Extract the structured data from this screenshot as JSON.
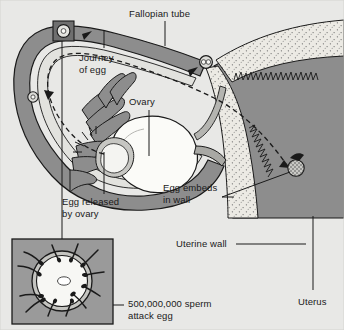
{
  "figure": {
    "background_color": "#e8e8e6",
    "ink_color": "#1a1a1a"
  },
  "palette": {
    "background": "#e8e8e6",
    "tube_wall": "#8d8d8d",
    "tube_lumen": "#e2e2de",
    "uterus_muscle": "#8d8d8d",
    "uterine_wall_stipple": "#eceae4",
    "ovary_fill": "#fbfbf8",
    "inset_background": "#9a9a9a",
    "egg_marker_fill": "#dddddd",
    "outline": "#1a1a1a"
  },
  "labels": [
    {
      "id": "fallopian-tube",
      "text": "Fallopian tube",
      "x": 129,
      "y": 8,
      "lines": [
        "Fallopian tube"
      ]
    },
    {
      "id": "journey-of-egg",
      "text": "Journey of egg",
      "x": 79,
      "y": 52,
      "lines": [
        "Journey",
        "of egg"
      ]
    },
    {
      "id": "ovary",
      "text": "Ovary",
      "x": 129,
      "y": 96,
      "lines": [
        "Ovary"
      ]
    },
    {
      "id": "egg-released",
      "text": "Egg released by ovary",
      "x": 62,
      "y": 198,
      "lines": [
        "Egg released",
        "by ovary"
      ]
    },
    {
      "id": "egg-embeds",
      "text": "Egg embeds in wall",
      "x": 163,
      "y": 183,
      "lines": [
        "Egg embeds",
        "in wall"
      ]
    },
    {
      "id": "uterine-wall",
      "text": "Uterine wall",
      "x": 176,
      "y": 239,
      "lines": [
        "Uterine wall"
      ]
    },
    {
      "id": "uterus",
      "text": "Uterus",
      "x": 298,
      "y": 296,
      "lines": [
        "Uterus"
      ]
    },
    {
      "id": "sperm-attack",
      "text": "500,000,000 sperm attack egg",
      "x": 128,
      "y": 299,
      "lines": [
        "500,000,000 sperm",
        "attack egg"
      ]
    }
  ],
  "structures": [
    {
      "id": "fallopian-tube",
      "name": "Fallopian tube",
      "description": "Long curved muscular tube with an inner lumen running from the fimbriae to the uterus"
    },
    {
      "id": "ovary",
      "name": "Ovary",
      "description": "Pale oval organ below the tube where the egg is released"
    },
    {
      "id": "fimbriae",
      "name": "Fimbriae",
      "description": "Finger-like projections at the open end of the tube that sweep the egg inward"
    },
    {
      "id": "uterus",
      "name": "Uterus",
      "description": "Large dark muscular cavity on the right side of the diagram"
    },
    {
      "id": "uterine-wall",
      "name": "Uterine wall",
      "description": "Stippled lining layer of the uterus"
    },
    {
      "id": "embedded-egg",
      "name": "Embedded egg",
      "description": "Stippled round egg implanted in the uterine wall"
    }
  ],
  "journey_markers": [
    {
      "id": "marker-released",
      "stage": "Egg released by ovary",
      "x": 33,
      "y": 97,
      "r": 5.0,
      "boxed": false
    },
    {
      "id": "marker-boxed",
      "stage": "Sperm attack egg (inset)",
      "x": 64,
      "y": 31,
      "r": 5.4,
      "boxed": true
    },
    {
      "id": "marker-dividing",
      "stage": "Fertilised egg dividing",
      "x": 206,
      "y": 62,
      "r": 5.6,
      "boxed": false
    },
    {
      "id": "marker-embedded",
      "stage": "Egg embeds in wall",
      "x": 296,
      "y": 168,
      "r": 7.5,
      "boxed": false
    }
  ],
  "inset": {
    "id": "sperm-inset",
    "caption": "500,000,000 sperm attack egg",
    "x": 12,
    "y": 239,
    "width": 101,
    "height": 85,
    "egg": {
      "cx": 62,
      "cy": 281,
      "outer_r": 30,
      "membrane_r": 26,
      "nucleus_rx": 6,
      "nucleus_ry": 4
    },
    "sperm_count": 12
  },
  "leader_lines": [
    {
      "id": "leader-fallopian-tube",
      "from_label": "fallopian-tube",
      "x1": 165,
      "y1": 20,
      "x2": 165,
      "y2": 44
    },
    {
      "id": "leader-journey",
      "from_label": "journey-of-egg",
      "x1": 104,
      "y1": 28,
      "x2": 104,
      "y2": 47
    },
    {
      "id": "leader-ovary",
      "from_label": "ovary",
      "x1": 149,
      "y1": 110,
      "x2": 149,
      "y2": 155
    },
    {
      "id": "leader-egg-released",
      "from_label": "egg-released",
      "x1": 104,
      "y1": 152,
      "x2": 104,
      "y2": 194
    },
    {
      "id": "leader-inset",
      "from_label": "sperm-inset",
      "x1": 62,
      "y1": 31,
      "x2": 62,
      "y2": 239
    },
    {
      "id": "leader-egg-embeds",
      "from_label": "egg-embeds",
      "x1": 222,
      "y1": 197,
      "x2": 293,
      "y2": 172
    },
    {
      "id": "leader-uterine-wall",
      "from_label": "uterine-wall",
      "x1": 232,
      "y1": 244,
      "x2": 300,
      "y2": 244
    },
    {
      "id": "leader-uterus",
      "from_label": "uterus",
      "x1": 313,
      "y1": 218,
      "x2": 313,
      "y2": 290
    },
    {
      "id": "leader-sperm-attack",
      "from_label": "sperm-attack",
      "x1": 100,
      "y1": 305,
      "x2": 124,
      "y2": 305
    }
  ]
}
